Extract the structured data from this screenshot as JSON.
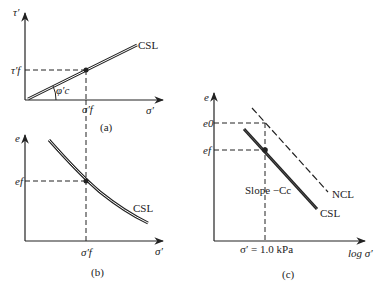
{
  "panels": {
    "a": {
      "caption": "(a)",
      "y_axis_label": "τ′",
      "x_axis_label": "σ′",
      "y_tick": "τ′f",
      "x_tick": "σ′f",
      "angle_label": "φ′c",
      "line_label": "CSL"
    },
    "b": {
      "caption": "(b)",
      "y_axis_label": "e",
      "x_axis_label": "σ′",
      "y_tick": "ef",
      "x_tick": "σ′f",
      "line_label": "CSL"
    },
    "c": {
      "caption": "(c)",
      "y_axis_label": "e",
      "x_axis_label": "log σ′",
      "y_tick_top": "e0",
      "y_tick_bottom": "ef",
      "x_tick": "σ′ = 1.0 kPa",
      "slope_label": "Slope −Cc",
      "ncl_label": "NCL",
      "csl_label": "CSL"
    }
  },
  "colors": {
    "ink": "#222222",
    "background": "#ffffff"
  }
}
